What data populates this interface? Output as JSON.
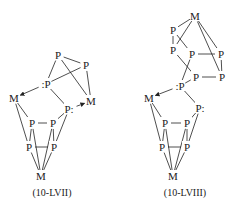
{
  "structures": [
    {
      "id": "10-LVII",
      "caption": "(10-LVII)",
      "caption_pos": [
        52,
        196
      ],
      "atoms": [
        {
          "label": "P",
          "x": 58,
          "y": 55
        },
        {
          "label": "P",
          "x": 86,
          "y": 65
        },
        {
          "label": ":P",
          "x": 46,
          "y": 84
        },
        {
          "label": "M",
          "x": 14,
          "y": 98
        },
        {
          "label": "M",
          "x": 91,
          "y": 101
        },
        {
          "label": "P:",
          "x": 69,
          "y": 109
        },
        {
          "label": "P",
          "x": 32,
          "y": 123
        },
        {
          "label": "P",
          "x": 53,
          "y": 123
        },
        {
          "label": "P",
          "x": 29,
          "y": 147
        },
        {
          "label": "P",
          "x": 54,
          "y": 147
        },
        {
          "label": "M",
          "x": 41,
          "y": 176
        }
      ],
      "bonds": [
        [
          0,
          1
        ],
        [
          0,
          2
        ],
        [
          0,
          4
        ],
        [
          1,
          2
        ],
        [
          1,
          4
        ],
        [
          2,
          5
        ],
        [
          3,
          6
        ],
        [
          3,
          8
        ],
        [
          6,
          7
        ],
        [
          7,
          5
        ],
        [
          8,
          9
        ],
        [
          5,
          9
        ],
        [
          6,
          8
        ],
        [
          7,
          9
        ],
        [
          6,
          10
        ],
        [
          7,
          10
        ],
        [
          8,
          10
        ],
        [
          9,
          10
        ]
      ],
      "arrows": [
        [
          2,
          3
        ],
        [
          5,
          4
        ]
      ]
    },
    {
      "id": "10-LVIII",
      "caption": "(10-LVIII)",
      "caption_pos": [
        185,
        196
      ],
      "atoms": [
        {
          "label": "M",
          "x": 195,
          "y": 16
        },
        {
          "label": "P",
          "x": 173,
          "y": 30
        },
        {
          "label": "P",
          "x": 173,
          "y": 50
        },
        {
          "label": "P",
          "x": 192,
          "y": 54
        },
        {
          "label": "P",
          "x": 221,
          "y": 54
        },
        {
          "label": "P",
          "x": 196,
          "y": 77
        },
        {
          "label": "P",
          "x": 222,
          "y": 77
        },
        {
          "label": ":P",
          "x": 180,
          "y": 86
        },
        {
          "label": "M",
          "x": 149,
          "y": 98
        },
        {
          "label": "P:",
          "x": 200,
          "y": 108
        },
        {
          "label": "P",
          "x": 165,
          "y": 123
        },
        {
          "label": "P",
          "x": 187,
          "y": 123
        },
        {
          "label": "P",
          "x": 162,
          "y": 147
        },
        {
          "label": "P",
          "x": 187,
          "y": 147
        },
        {
          "label": "M",
          "x": 173,
          "y": 176
        }
      ],
      "bonds": [
        [
          0,
          1
        ],
        [
          0,
          2
        ],
        [
          0,
          4
        ],
        [
          0,
          6
        ],
        [
          1,
          2
        ],
        [
          1,
          3
        ],
        [
          2,
          5
        ],
        [
          3,
          4
        ],
        [
          3,
          7
        ],
        [
          4,
          6
        ],
        [
          5,
          6
        ],
        [
          5,
          7
        ],
        [
          7,
          9
        ],
        [
          8,
          10
        ],
        [
          8,
          12
        ],
        [
          10,
          11
        ],
        [
          11,
          9
        ],
        [
          12,
          13
        ],
        [
          9,
          13
        ],
        [
          10,
          12
        ],
        [
          11,
          13
        ],
        [
          10,
          14
        ],
        [
          11,
          14
        ],
        [
          12,
          14
        ],
        [
          13,
          14
        ]
      ],
      "arrows": [
        [
          7,
          8
        ]
      ]
    }
  ]
}
